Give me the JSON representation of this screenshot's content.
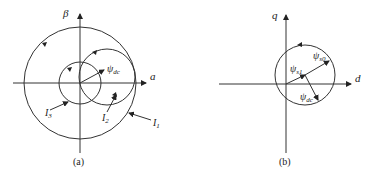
{
  "panel_a": {
    "caption": "(a)",
    "axis_x_label": "a",
    "axis_y_label": "β",
    "vector_label": "ψ",
    "vector_sub": "dc",
    "circle_labels": [
      {
        "main": "I",
        "sub": "1"
      },
      {
        "main": "I",
        "sub": "2"
      },
      {
        "main": "I",
        "sub": "3"
      }
    ]
  },
  "panel_b": {
    "caption": "(b)",
    "axis_x_label": "d",
    "axis_y_label": "q",
    "vectors": [
      {
        "main": "ψ",
        "sub": "s1"
      },
      {
        "main": "ψ",
        "sub": "s0"
      },
      {
        "main": "ψ",
        "sub": "dc"
      }
    ]
  }
}
